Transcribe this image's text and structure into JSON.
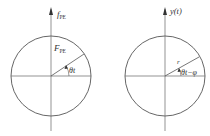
{
  "diagrams": [
    {
      "name": "phasor-force",
      "axis_label_main": "f",
      "axis_label_sub": "PE",
      "radius_label_main": "F",
      "radius_label_sub": "PE",
      "angle_label": "θt"
    },
    {
      "name": "phasor-response",
      "axis_label": "y(t)",
      "radius_label": "r",
      "angle_label": "θt−φ"
    }
  ],
  "colors": {
    "stroke": "#555555",
    "text": "#333333",
    "background": "#ffffff"
  }
}
